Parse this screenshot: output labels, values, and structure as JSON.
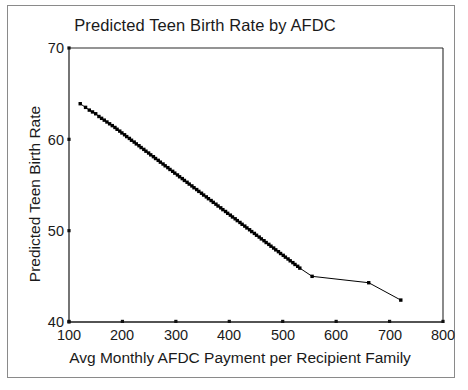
{
  "chart_data": {
    "type": "line",
    "title": "Predicted Teen Birth Rate by AFDC",
    "xlabel": "Avg Monthly AFDC Payment per Recipient Family",
    "ylabel": "Predicted Teen Birth Rate",
    "xlim": [
      100,
      800
    ],
    "ylim": [
      40,
      70
    ],
    "xticks": [
      100,
      200,
      300,
      400,
      500,
      600,
      700,
      800
    ],
    "yticks": [
      40,
      50,
      60,
      70
    ],
    "grid": false,
    "legend": null,
    "marker": "small-filled-square",
    "line_color": "#000000",
    "series": [
      {
        "name": "Predicted Teen Birth Rate",
        "x": [
          121,
          131,
          138,
          144,
          150,
          156,
          161,
          166,
          171,
          176,
          181,
          186,
          190,
          195,
          199,
          204,
          208,
          213,
          217,
          222,
          226,
          231,
          235,
          240,
          244,
          249,
          253,
          258,
          262,
          267,
          271,
          276,
          280,
          285,
          289,
          294,
          298,
          303,
          307,
          312,
          316,
          321,
          325,
          330,
          334,
          339,
          343,
          348,
          352,
          357,
          361,
          366,
          370,
          375,
          379,
          384,
          388,
          393,
          397,
          402,
          406,
          411,
          415,
          420,
          424,
          429,
          433,
          438,
          442,
          447,
          451,
          456,
          460,
          465,
          469,
          474,
          478,
          483,
          487,
          492,
          496,
          501,
          505,
          510,
          514,
          519,
          523,
          528,
          532,
          555,
          661,
          721
        ],
        "y": [
          63.9,
          63.5,
          63.2,
          63.0,
          62.8,
          62.5,
          62.3,
          62.1,
          61.9,
          61.7,
          61.5,
          61.3,
          61.1,
          60.9,
          60.7,
          60.5,
          60.3,
          60.1,
          59.9,
          59.7,
          59.5,
          59.3,
          59.1,
          58.9,
          58.7,
          58.5,
          58.3,
          58.1,
          57.9,
          57.7,
          57.5,
          57.3,
          57.1,
          56.9,
          56.7,
          56.5,
          56.3,
          56.1,
          55.9,
          55.7,
          55.5,
          55.3,
          55.1,
          54.9,
          54.7,
          54.5,
          54.3,
          54.1,
          53.9,
          53.7,
          53.5,
          53.3,
          53.1,
          52.9,
          52.7,
          52.5,
          52.3,
          52.1,
          51.9,
          51.7,
          51.5,
          51.3,
          51.1,
          50.9,
          50.7,
          50.5,
          50.3,
          50.1,
          49.9,
          49.7,
          49.5,
          49.3,
          49.1,
          48.9,
          48.7,
          48.5,
          48.3,
          48.1,
          47.9,
          47.7,
          47.5,
          47.3,
          47.1,
          46.9,
          46.7,
          46.5,
          46.3,
          46.1,
          45.9,
          45.0,
          44.3,
          42.4
        ]
      }
    ]
  }
}
